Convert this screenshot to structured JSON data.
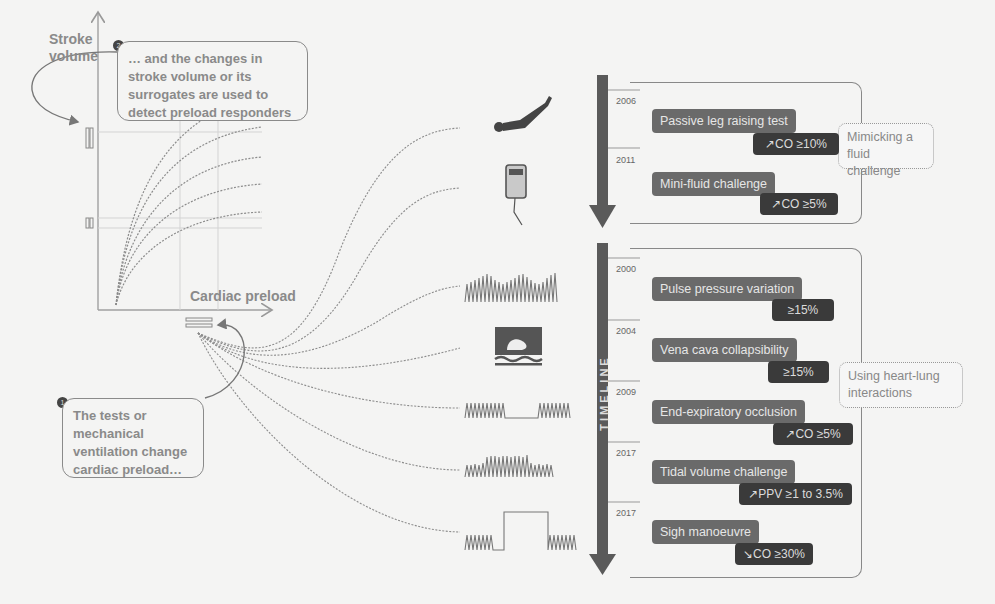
{
  "callouts": {
    "step2": {
      "number": "2",
      "text": "… and the changes in stroke volume or its surrogates are used to detect preload responders"
    },
    "step1": {
      "number": "1",
      "text": "The tests or mechanical ventilation change cardiac preload…"
    }
  },
  "axes": {
    "y_label": "Stroke volume",
    "x_label": "Cardiac preload"
  },
  "timeline": {
    "label": "TIMELINE"
  },
  "groups": [
    {
      "label": "Mimicking a fluid challenge"
    },
    {
      "label": "Using heart-lung interactions"
    }
  ],
  "tests": [
    {
      "year": "2006",
      "name": "Passive leg raising test",
      "threshold": "↗CO ≥10%",
      "icon": "leg-raise-icon"
    },
    {
      "year": "2011",
      "name": "Mini-fluid challenge",
      "threshold": "↗CO ≥5%",
      "icon": "fluid-bag-icon"
    },
    {
      "year": "2000",
      "name": "Pulse pressure variation",
      "threshold": "≥15%",
      "icon": "pressure-waveform-icon"
    },
    {
      "year": "2004",
      "name": "Vena cava collapsibility",
      "threshold": "≥15%",
      "icon": "ultrasound-icon"
    },
    {
      "year": "2009",
      "name": "End-expiratory occlusion",
      "threshold": "↗CO ≥5%",
      "icon": "occlusion-waveform-icon"
    },
    {
      "year": "2017",
      "name": "Tidal volume challenge",
      "threshold": "↗PPV ≥1 to 3.5%",
      "icon": "tidal-waveform-icon"
    },
    {
      "year": "2017",
      "name": "Sigh manoeuvre",
      "threshold": "↘CO ≥30%",
      "icon": "sigh-waveform-icon"
    }
  ],
  "colors": {
    "background": "#f4f4f3",
    "test_box": "#6a6a6a",
    "threshold_box": "#3a3a3a",
    "timeline_arrow": "#5a5a5a",
    "lines": "#8a8a8a"
  }
}
